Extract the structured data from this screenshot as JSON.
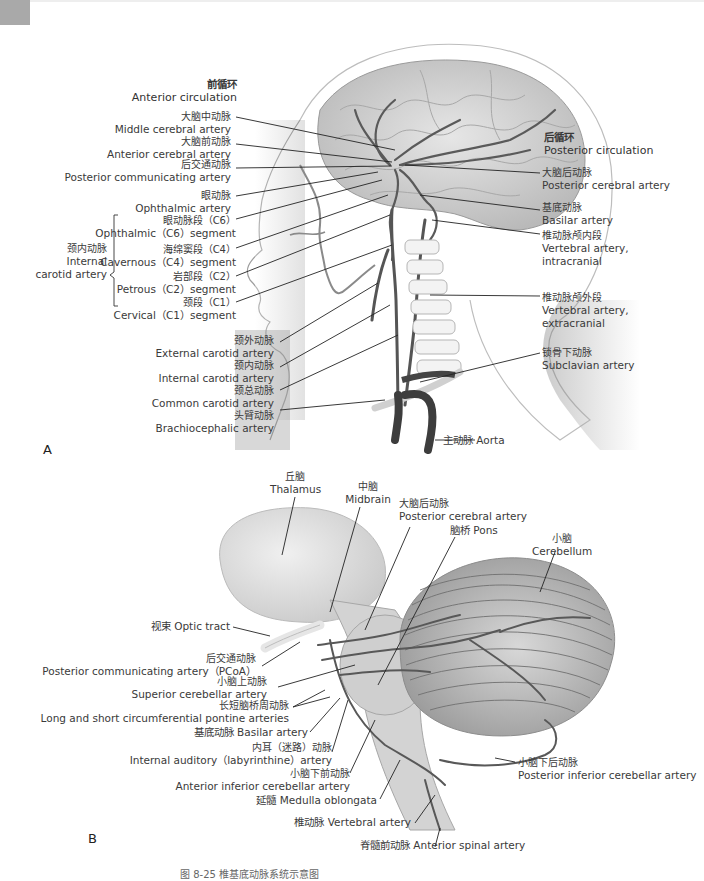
{
  "figure": {
    "panel_a_letter": "A",
    "panel_b_letter": "B",
    "caption": "图 8-25  椎基底动脉系统示意图"
  },
  "panel_a": {
    "anterior_header": {
      "zh": "前循环",
      "en": "Anterior circulation"
    },
    "posterior_header": {
      "zh": "后循环",
      "en": "Posterior circulation"
    },
    "left_labels": [
      {
        "zh": "大脑中动脉",
        "en": "Middle cerebral artery"
      },
      {
        "zh": "大脑前动脉",
        "en": "Anterior cerebral artery"
      },
      {
        "zh": "后交通动脉",
        "en": "Posterior communicating artery"
      },
      {
        "zh": "眼动脉",
        "en": "Ophthalmic artery"
      }
    ],
    "ica_group": {
      "zh": "颈内动脉",
      "en": "Internal carotid artery",
      "segments": [
        {
          "zh": "眼动脉段（C6）",
          "en": "Ophthalmic（C6）segment"
        },
        {
          "zh": "海绵窦段（C4）",
          "en": "Cavernous（C4）segment"
        },
        {
          "zh": "岩部段（C2）",
          "en": "Petrous（C2）segment"
        },
        {
          "zh": "颈段（C1）",
          "en": "Cervical（C1）segment"
        }
      ]
    },
    "lower_left_labels": [
      {
        "zh": "颈外动脉",
        "en": "External carotid artery"
      },
      {
        "zh": "颈内动脉",
        "en": "Internal carotid artery"
      },
      {
        "zh": "颈总动脉",
        "en": "Common carotid artery"
      },
      {
        "zh": "头臂动脉",
        "en": "Brachiocephalic artery"
      }
    ],
    "right_labels": [
      {
        "zh": "大脑后动脉",
        "en": "Posterior cerebral artery"
      },
      {
        "zh": "基底动脉",
        "en": "Basilar artery"
      },
      {
        "zh": "椎动脉颅内段",
        "en": "Vertebral artery,",
        "en2": "intracranial"
      },
      {
        "zh": "椎动脉颅外段",
        "en": "Vertebral artery,",
        "en2": "extracranial"
      },
      {
        "zh": "锁骨下动脉",
        "en": "Subclavian artery"
      }
    ],
    "aorta": "主动脉 Aorta"
  },
  "panel_b": {
    "thalamus": {
      "zh": "丘脑",
      "en": "Thalamus"
    },
    "midbrain": {
      "zh": "中脑",
      "en": "Midbrain"
    },
    "pca": {
      "zh": "大脑后动脉",
      "en": "Posterior cerebral artery"
    },
    "pons": "脑桥 Pons",
    "cerebellum": {
      "zh": "小脑",
      "en": "Cerebellum"
    },
    "optic_tract": "视束 Optic tract",
    "pcoa": {
      "zh": "后交通动脉",
      "en": "Posterior communicating artery（PCoA）"
    },
    "sca": {
      "zh": "小脑上动脉",
      "en": "Superior cerebellar artery"
    },
    "pontine": {
      "zh": "长短脑桥周动脉",
      "en": "Long and short circumferential pontine arteries"
    },
    "basilar": "基底动脉 Basilar artery",
    "labyrinthine": {
      "zh": "内耳（迷路）动脉",
      "en": "Internal auditory（labyrinthine）artery"
    },
    "aica": {
      "zh": "小脑下前动脉",
      "en": "Anterior inferior cerebellar artery"
    },
    "medulla": "延髓 Medulla oblongata",
    "vertebral": "椎动脉 Vertebral artery",
    "anterior_spinal": "脊髓前动脉 Anterior spinal artery",
    "pica": {
      "zh": "小脑下后动脉",
      "en": "Posterior inferior cerebellar artery"
    }
  },
  "colors": {
    "artery": "#5a5a5a",
    "brain": "#d4d4d4",
    "leader": "#222222",
    "text": "#3a3a3a"
  }
}
